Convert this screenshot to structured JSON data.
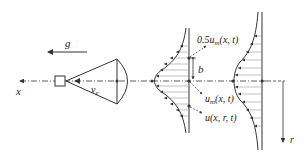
{
  "diagram": {
    "labels": {
      "gravity": "g",
      "x_axis": "x",
      "r_axis": "r",
      "velocity": "v",
      "velocity_sub": "e",
      "half_width": "b",
      "half_max": "0.5u",
      "half_max_sub": "m",
      "half_max_args": "(x, t)",
      "centerline": "u",
      "centerline_sub": "m",
      "centerline_args": "(x, t)",
      "profile": "u(x, r, t)"
    },
    "colors": {
      "line": "#333333",
      "background": "#ffffff"
    }
  }
}
